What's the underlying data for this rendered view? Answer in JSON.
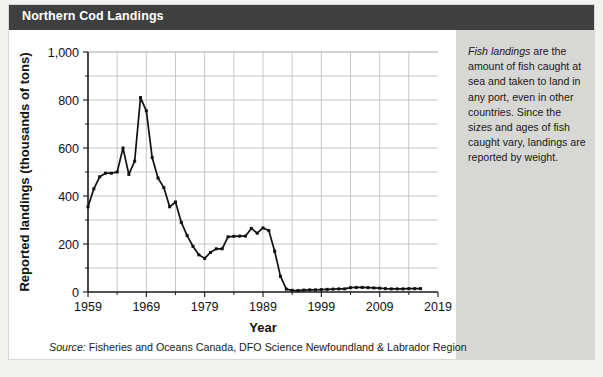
{
  "header": {
    "title": "Northern Cod Landings",
    "background_color": "#3f3f3f",
    "text_color": "#ffffff"
  },
  "sidebar": {
    "background_color": "#d7d7d5",
    "note_emphasis": "Fish landings",
    "note_body": " are the amount of fish caught at sea and taken to land in any port, even in other countries. Since the sizes and ages of fish caught vary, landings are reported by weight."
  },
  "source": {
    "label": "Source:",
    "text": " Fisheries and Oceans Canada, DFO Science Newfoundland & Labrador Region"
  },
  "chart_data": {
    "type": "line",
    "title": "Northern Cod Landings",
    "xlabel": "Year",
    "ylabel": "Reported landings (thousands of tons)",
    "xlim": [
      1959,
      2019
    ],
    "ylim": [
      0,
      1000
    ],
    "y_ticks": [
      0,
      200,
      400,
      600,
      800,
      1000
    ],
    "y_tick_labels": [
      "0",
      "200",
      "400",
      "600",
      "800",
      "1,000"
    ],
    "y_minor_ticks": [
      100,
      300,
      500,
      700,
      900
    ],
    "x_ticks": [
      1959,
      1969,
      1979,
      1989,
      1999,
      2009,
      2019
    ],
    "x_tick_labels": [
      "1959",
      "1969",
      "1979",
      "1989",
      "1999",
      "2009",
      "2019"
    ],
    "x_gridlines": [
      1964,
      1969,
      1974,
      1979,
      1984,
      1989,
      1994,
      1999,
      2004,
      2009,
      2014
    ],
    "grid": true,
    "legend": "none",
    "line_color": "#111111",
    "series_name": "Reported landings",
    "x": [
      1959,
      1960,
      1961,
      1962,
      1963,
      1964,
      1965,
      1966,
      1967,
      1968,
      1969,
      1970,
      1971,
      1972,
      1973,
      1974,
      1975,
      1976,
      1977,
      1978,
      1979,
      1980,
      1981,
      1982,
      1983,
      1984,
      1985,
      1986,
      1987,
      1988,
      1989,
      1990,
      1991,
      1992,
      1993,
      1994,
      1995,
      1996,
      1997,
      1998,
      1999,
      2000,
      2001,
      2002,
      2003,
      2004,
      2005,
      2006,
      2007,
      2008,
      2009,
      2010,
      2011,
      2012,
      2013,
      2014,
      2015,
      2016
    ],
    "values": [
      355,
      430,
      480,
      495,
      495,
      500,
      600,
      490,
      545,
      810,
      755,
      560,
      475,
      435,
      355,
      375,
      290,
      235,
      190,
      155,
      140,
      165,
      180,
      180,
      230,
      232,
      233,
      233,
      265,
      245,
      267,
      256,
      170,
      65,
      12,
      7,
      6,
      8,
      9,
      9,
      10,
      11,
      12,
      13,
      13,
      18,
      19,
      19,
      18,
      17,
      16,
      14,
      13,
      13,
      13,
      14,
      14,
      14
    ]
  }
}
